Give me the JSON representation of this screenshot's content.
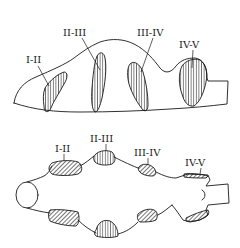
{
  "figure": {
    "colors": {
      "ink": "#1a1a1a",
      "background": "#ffffff"
    },
    "side_view": {
      "labels": {
        "r1": "I-II",
        "r2": "II-III",
        "r3": "III-IV",
        "r4": "IV-V"
      },
      "hatch_style": "vertical"
    },
    "top_view": {
      "labels": {
        "r1": "I-II",
        "r2": "II-III",
        "r3": "III-IV",
        "r4": "IV-V"
      },
      "hatch_style": "diagonal"
    }
  }
}
